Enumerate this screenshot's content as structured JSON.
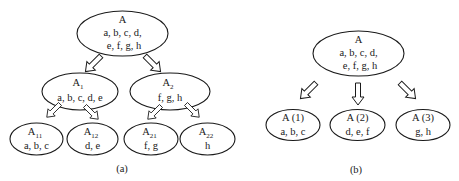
{
  "diagram_a": {
    "caption": "(a)",
    "root": {
      "label": "A",
      "line1": "a, b, c, d,",
      "line2": "e, f, g, h"
    },
    "level1": [
      {
        "label": "A",
        "sub": "1",
        "line1": "a, b, c, d, e"
      },
      {
        "label": "A",
        "sub": "2",
        "line1": "f, g, h"
      }
    ],
    "level2": [
      {
        "label": "A",
        "sub": "11",
        "line1": "a, b, c"
      },
      {
        "label": "A",
        "sub": "12",
        "line1": "d, e"
      },
      {
        "label": "A",
        "sub": "21",
        "line1": "f, g"
      },
      {
        "label": "A",
        "sub": "22",
        "line1": "h"
      }
    ]
  },
  "diagram_b": {
    "caption": "(b)",
    "root": {
      "label": "A",
      "line1": "a, b, c, d,",
      "line2": "e, f, g, h"
    },
    "children": [
      {
        "label": "A (1)",
        "line1": "a, b, c"
      },
      {
        "label": "A (2)",
        "line1": "d, e, f"
      },
      {
        "label": "A (3)",
        "line1": "g, h"
      }
    ]
  },
  "colors": {
    "stroke": "#1a1a1a",
    "background": "#ffffff"
  }
}
